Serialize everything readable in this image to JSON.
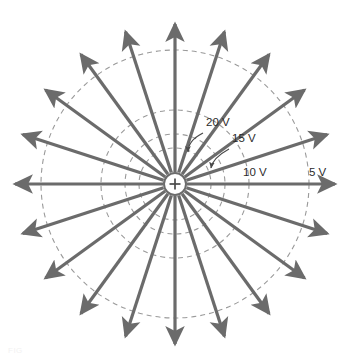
{
  "figure": {
    "background_color": "#ffffff",
    "width": 346,
    "height": 357
  },
  "charge": {
    "symbol": "+",
    "sign": "positive",
    "center_x": 175,
    "center_y": 184,
    "marker_radius": 11,
    "fill_color": "#ffffff",
    "stroke_color": "#6b6b6b"
  },
  "field_lines": {
    "count": 20,
    "angle_step_degrees": 18,
    "start_angle_degrees": 0,
    "direction": "outward",
    "color": "#6b6b6b",
    "stroke_width": 3.2,
    "arrowhead": "solid-triangle",
    "inner_radius": 12,
    "outer_radius": 160
  },
  "equipotentials": {
    "color": "#9a9a9a",
    "stroke_width": 1.1,
    "dash": "5 4",
    "circles": [
      {
        "label": "20 V",
        "voltage": 20,
        "unit": "V",
        "radius": 36
      },
      {
        "label": "15 V",
        "voltage": 15,
        "unit": "V",
        "radius": 50
      },
      {
        "label": "10 V",
        "voltage": 10,
        "unit": "V",
        "radius": 74
      },
      {
        "label": "5 V",
        "voltage": 5,
        "unit": "V",
        "radius": 134
      }
    ]
  },
  "labels": {
    "v20": {
      "text": "20 V",
      "x": 206,
      "y": 126
    },
    "v15": {
      "text": "15 V",
      "x": 232,
      "y": 142
    },
    "v10": {
      "text": "10 V",
      "x": 243,
      "y": 176
    },
    "v5": {
      "text": "5 V",
      "x": 309,
      "y": 176
    }
  },
  "leaders": [
    {
      "name": "leader-20v",
      "from_label": "20 V",
      "path": "M 203 133 C 193 138 188 145 188 152",
      "arrow_x": 188,
      "arrow_y": 155,
      "arrow_angle_degrees": 100
    },
    {
      "name": "leader-15v",
      "from_label": "15 V",
      "path": "M 229 149 C 218 155 212 162 211 168",
      "arrow_x": 211,
      "arrow_y": 171,
      "arrow_angle_degrees": 100
    }
  ],
  "caption_ghost": "FIG",
  "chart_data": {
    "type": "scatter",
    "xlabel": "",
    "ylabel": "",
    "categories": [
      "20 V",
      "15 V",
      "10 V",
      "5 V"
    ],
    "values": [
      20,
      15,
      10,
      5
    ],
    "series": [
      {
        "name": "equipotential radius (px)",
        "values": [
          36,
          50,
          74,
          134
        ]
      }
    ],
    "annotations": [
      "20 V",
      "15 V",
      "10 V",
      "5 V",
      "+"
    ],
    "grid": false,
    "legend_position": "none"
  }
}
